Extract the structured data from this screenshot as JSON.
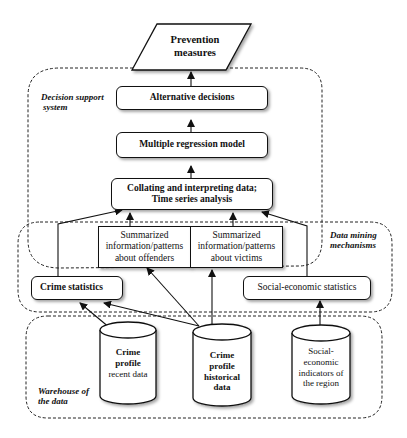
{
  "diagram": {
    "nodes": {
      "prevention": {
        "label_line1": "Prevention",
        "label_line2": "measures",
        "shape": "parallelogram"
      },
      "alternative": {
        "label": "Alternative decisions",
        "shape": "rounded-rect"
      },
      "regression": {
        "label": "Multiple regression model",
        "shape": "rounded-rect"
      },
      "collating": {
        "label_line1": "Collating and interpreting data;",
        "label_line2": "Time series analysis",
        "shape": "rounded-rect"
      },
      "offenders": {
        "label_line1": "Summarized",
        "label_line2": "information/patterns",
        "label_line3": "about offenders",
        "shape": "rect"
      },
      "victims": {
        "label_line1": "Summarized",
        "label_line2": "information/patterns",
        "label_line3": "about victims",
        "shape": "rect"
      },
      "crime_stats": {
        "label": "Crime statistics",
        "shape": "rounded-rect"
      },
      "socio_stats": {
        "label": "Social-economic statistics",
        "shape": "rounded-rect"
      },
      "recent_db": {
        "label_line1": "Crime",
        "label_line2": "profile",
        "label_line3": "recent data",
        "shape": "cylinder"
      },
      "historical_db": {
        "label_line1": "Crime",
        "label_line2": "profile",
        "label_line3": "historical",
        "label_line4": "data",
        "shape": "cylinder"
      },
      "socio_db": {
        "label_line1": "Social-",
        "label_line2": "economic",
        "label_line3": "indicators of",
        "label_line4": "the region",
        "shape": "cylinder"
      }
    },
    "regions": {
      "decision_support": {
        "label_line1": "Decision support",
        "label_line2": "system"
      },
      "data_mining": {
        "label_line1": "Data mining",
        "label_line2": "mechanisms"
      },
      "warehouse": {
        "label_line1": "Warehouse of",
        "label_line2": "the data"
      }
    },
    "edges": [
      {
        "from": "alternative",
        "to": "prevention"
      },
      {
        "from": "regression",
        "to": "alternative"
      },
      {
        "from": "collating",
        "to": "regression"
      },
      {
        "from": "offenders",
        "to": "collating"
      },
      {
        "from": "victims",
        "to": "collating"
      },
      {
        "from": "crime_stats",
        "to": "collating"
      },
      {
        "from": "socio_stats",
        "to": "collating"
      },
      {
        "from": "recent_db",
        "to": "crime_stats"
      },
      {
        "from": "historical_db",
        "to": "crime_stats"
      },
      {
        "from": "historical_db",
        "to": "offenders"
      },
      {
        "from": "historical_db",
        "to": "victims"
      },
      {
        "from": "socio_db",
        "to": "socio_stats"
      }
    ]
  }
}
